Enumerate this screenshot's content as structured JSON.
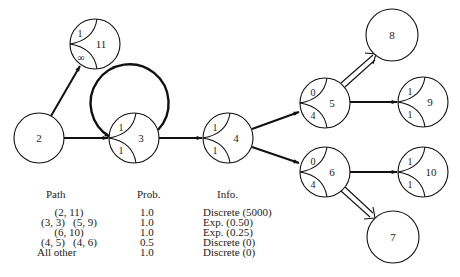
{
  "diagram": {
    "nodes": [
      {
        "id": "2",
        "label": "2",
        "top": "",
        "bottom": ""
      },
      {
        "id": "11",
        "label": "11",
        "top": "1",
        "bottom": "∞"
      },
      {
        "id": "3",
        "label": "3",
        "top": "1",
        "bottom": "1"
      },
      {
        "id": "4",
        "label": "4",
        "top": "1",
        "bottom": "1"
      },
      {
        "id": "5",
        "label": "5",
        "top": "0",
        "bottom": "4"
      },
      {
        "id": "6",
        "label": "6",
        "top": "0",
        "bottom": "4"
      },
      {
        "id": "8",
        "label": "8",
        "top": "",
        "bottom": ""
      },
      {
        "id": "9",
        "label": "9",
        "top": "1",
        "bottom": "1"
      },
      {
        "id": "10",
        "label": "10",
        "top": "1",
        "bottom": "1"
      },
      {
        "id": "7",
        "label": "7",
        "top": "",
        "bottom": ""
      }
    ],
    "edges": [
      {
        "from": "2",
        "to": "11",
        "style": "single"
      },
      {
        "from": "2",
        "to": "3",
        "style": "single"
      },
      {
        "from": "3",
        "to": "3",
        "style": "self-loop"
      },
      {
        "from": "3",
        "to": "4",
        "style": "single"
      },
      {
        "from": "4",
        "to": "5",
        "style": "single"
      },
      {
        "from": "4",
        "to": "6",
        "style": "single"
      },
      {
        "from": "5",
        "to": "8",
        "style": "double"
      },
      {
        "from": "5",
        "to": "9",
        "style": "single"
      },
      {
        "from": "6",
        "to": "10",
        "style": "single"
      },
      {
        "from": "6",
        "to": "7",
        "style": "double"
      }
    ]
  },
  "table": {
    "headers": {
      "path": "Path",
      "prob": "Prob.",
      "info": "Info."
    },
    "rows": [
      {
        "path": "(2, 11)",
        "prob": "1.0",
        "info": "Discrete (5000)"
      },
      {
        "path": "(3, 3)   (5, 9)",
        "prob": "1.0",
        "info": "Exp. (0.50)"
      },
      {
        "path": "(6, 10)",
        "prob": "1.0",
        "info": "Exp. (0.25)"
      },
      {
        "path": "(4, 5)   (4, 6)",
        "prob": "0.5",
        "info": "Discrete (0)"
      },
      {
        "path": "All other",
        "prob": "1.0",
        "info": "Discrete (0)"
      }
    ]
  }
}
